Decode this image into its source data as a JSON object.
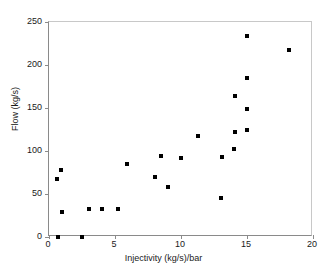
{
  "chart_data": {
    "type": "scatter",
    "title": "",
    "xlabel": "Injectivity (kg/s)/bar",
    "ylabel": "Flow (kg/s)",
    "xlim": [
      0,
      20
    ],
    "ylim": [
      0,
      250
    ],
    "xticks": [
      0,
      5,
      10,
      15,
      20
    ],
    "yticks": [
      0,
      50,
      100,
      150,
      200,
      250
    ],
    "xtick_labels": [
      "0",
      "5",
      "10",
      "15",
      "20"
    ],
    "ytick_labels": [
      "0",
      "50",
      "100",
      "150",
      "200",
      "250"
    ],
    "grid": false,
    "legend": null,
    "marker": {
      "shape": "square",
      "color": "#000000",
      "size_px": 4
    },
    "series": [
      {
        "name": "Flow vs Injectivity",
        "points": [
          {
            "x": 0.7,
            "y": 0
          },
          {
            "x": 2.5,
            "y": 0
          },
          {
            "x": 0.6,
            "y": 68
          },
          {
            "x": 0.9,
            "y": 78
          },
          {
            "x": 1.0,
            "y": 29
          },
          {
            "x": 3.0,
            "y": 33
          },
          {
            "x": 4.0,
            "y": 33
          },
          {
            "x": 5.2,
            "y": 33
          },
          {
            "x": 5.9,
            "y": 85
          },
          {
            "x": 8.0,
            "y": 70
          },
          {
            "x": 8.5,
            "y": 94
          },
          {
            "x": 9.0,
            "y": 58
          },
          {
            "x": 10.0,
            "y": 92
          },
          {
            "x": 11.3,
            "y": 117
          },
          {
            "x": 13.0,
            "y": 45
          },
          {
            "x": 13.1,
            "y": 93
          },
          {
            "x": 14.0,
            "y": 102
          },
          {
            "x": 14.1,
            "y": 122
          },
          {
            "x": 14.1,
            "y": 164
          },
          {
            "x": 15.0,
            "y": 125
          },
          {
            "x": 15.0,
            "y": 149
          },
          {
            "x": 15.0,
            "y": 185
          },
          {
            "x": 15.0,
            "y": 234
          },
          {
            "x": 18.2,
            "y": 218
          }
        ]
      }
    ]
  }
}
